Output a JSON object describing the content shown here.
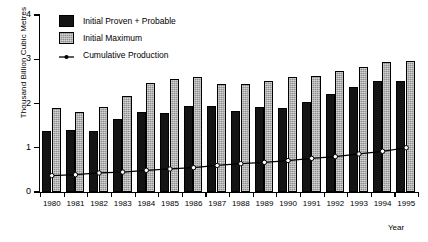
{
  "chart_data": {
    "type": "bar",
    "title": "",
    "xlabel": "Year",
    "ylabel": "Thousand Billion Cubic Metres",
    "categories": [
      "1980",
      "1981",
      "1982",
      "1983",
      "1984",
      "1985",
      "1986",
      "1987",
      "1988",
      "1989",
      "1990",
      "1991",
      "1992",
      "1993",
      "1994",
      "1995"
    ],
    "ylim": [
      0,
      4
    ],
    "yticks": [
      0,
      1,
      2,
      3,
      4
    ],
    "ytick_labels": [
      "0",
      "1",
      "2",
      "3",
      "4"
    ],
    "grid": false,
    "legend_position": "top-left",
    "series": [
      {
        "name": "Initial Proven + Probable",
        "type": "bar",
        "color": "#141414",
        "values": [
          1.37,
          1.4,
          1.37,
          1.64,
          1.81,
          1.78,
          1.94,
          1.94,
          1.82,
          1.91,
          1.9,
          2.03,
          2.22,
          2.37,
          2.5,
          2.52
        ]
      },
      {
        "name": "Initial Maximum",
        "type": "bar",
        "color": "#8f8f8f",
        "values": [
          1.9,
          1.8,
          1.92,
          2.17,
          2.47,
          2.55,
          2.6,
          2.45,
          2.43,
          2.52,
          2.6,
          2.62,
          2.73,
          2.83,
          2.93,
          2.97
        ]
      },
      {
        "name": "Cumulative Production",
        "type": "line",
        "color": "#000000",
        "values": [
          0.37,
          0.39,
          0.43,
          0.45,
          0.49,
          0.52,
          0.55,
          0.6,
          0.64,
          0.67,
          0.71,
          0.76,
          0.8,
          0.86,
          0.92,
          1.0
        ]
      }
    ]
  },
  "legend": {
    "items": [
      {
        "label": "Initial Proven + Probable",
        "key": "swatch-dark"
      },
      {
        "label": "Initial Maximum",
        "key": "swatch-hatched"
      },
      {
        "label": "Cumulative Production",
        "key": "line-marker"
      }
    ]
  },
  "axes": {
    "y_title": "Thousand Billion Cubic Metres",
    "x_title": "Year"
  }
}
